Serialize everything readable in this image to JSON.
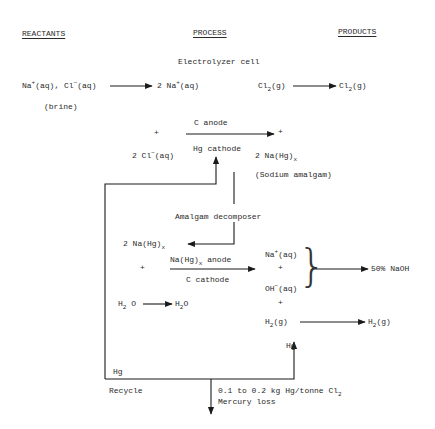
{
  "headers": {
    "reactants": "REACTANTS",
    "process": "PROCESS",
    "products": "PRODUCTS"
  },
  "electrolyzer": {
    "title": "Electrolyzer cell",
    "reactant": "Na+(aq), Cl−(aq)",
    "reactant_na": "Na",
    "reactant_na_sup": "+",
    "reactant_mid": "(aq), Cl",
    "reactant_cl_sup": "−",
    "reactant_end": "(aq)",
    "brine": "(brine)",
    "na_ion_prefix": "2 Na",
    "na_ion_sup": "+",
    "na_ion_suffix": "(aq)",
    "cl2_left": "Cl",
    "cl2_left_sub": "2",
    "cl2_left_suffix": "(g)",
    "cl2_product": "Cl",
    "cl2_product_sub": "2",
    "cl2_product_suffix": "(g)",
    "plus_left": "+",
    "anode_label": "C anode",
    "cathode_label": "Hg cathode",
    "plus_right": "+",
    "cl_ion_prefix": "2 Cl",
    "cl_ion_sup": "−",
    "cl_ion_suffix": "(aq)",
    "amalgam": "2 Na(Hg)",
    "amalgam_sub": "x",
    "amalgam_name": "(Sodium amalgam)"
  },
  "decomposer": {
    "title": "Amalgam decomposer",
    "amalgam": "2 Na(Hg)",
    "amalgam_sub": "x",
    "plus_left": "+",
    "anode_label": "Na(Hg)",
    "anode_label_sub": "x",
    "anode_label_suffix": " anode",
    "cathode_label": "C cathode",
    "na_ion": "Na",
    "na_ion_sup": "+",
    "na_ion_suffix": "(aq)",
    "plus_mid": "+",
    "oh_ion": "OH",
    "oh_ion_sup": "−",
    "oh_ion_suffix": "(aq)",
    "plus_bottom": "+",
    "naoh_product": "50% NaOH",
    "water_left": "H",
    "water_left_sub": "2",
    "water_left_suffix": " O",
    "water_right": "H",
    "water_right_sub": "2",
    "water_right_suffix": "O",
    "h2": "H",
    "h2_sub": "2",
    "h2_suffix": "(g)",
    "h2_product": "H",
    "h2_product_sub": "2",
    "h2_product_suffix": "(g)",
    "hg_out": "Hg"
  },
  "recycle": {
    "hg_label": "Hg",
    "recycle_label": "Recycle",
    "loss_amount": "0.1 to 0.2 kg Hg/tonne Cl",
    "loss_amount_sub": "2",
    "loss_label": "Mercury loss"
  },
  "colors": {
    "line": "#1a1a1a",
    "text": "#2a2a2a",
    "background": "#ffffff"
  }
}
